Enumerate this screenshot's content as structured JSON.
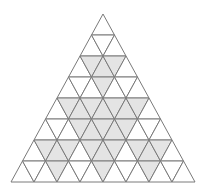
{
  "diagram": {
    "type": "triangular-grid",
    "rows": 8,
    "apex": [
      103,
      14
    ],
    "row_height": 21,
    "half_side": 11.5,
    "colors": {
      "background": "#ffffff",
      "shade": "#e4e4e4",
      "stroke": "#7a7a7a"
    },
    "shaded": {
      "0": [],
      "1": [],
      "2": [
        1,
        2,
        3
      ],
      "3": [
        3
      ],
      "4": [
        1,
        2,
        3,
        4,
        5,
        6,
        7
      ],
      "5": [
        3,
        4,
        5,
        6,
        7
      ],
      "6": [
        1,
        2,
        3,
        5,
        6,
        7,
        9,
        10,
        11
      ],
      "7": [
        3,
        7,
        11
      ]
    }
  }
}
